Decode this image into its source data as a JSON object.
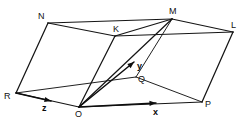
{
  "figure": {
    "kind": "parallelepiped-vector-diagram",
    "background_color": "#ffffff",
    "line_color": "#151515",
    "label_color": "#111111",
    "vertices": [
      {
        "id": "N",
        "label": "N",
        "point_x": 48,
        "point_y": 23,
        "label_x": 38,
        "label_y": 12
      },
      {
        "id": "M",
        "label": "M",
        "point_x": 172,
        "point_y": 19,
        "label_x": 169,
        "label_y": 7
      },
      {
        "id": "L",
        "label": "L",
        "point_x": 233,
        "point_y": 32,
        "label_x": 231,
        "label_y": 21
      },
      {
        "id": "K",
        "label": "K",
        "point_x": 115,
        "point_y": 36,
        "label_x": 113,
        "label_y": 25
      },
      {
        "id": "R",
        "label": "R",
        "point_x": 16,
        "point_y": 93,
        "label_x": 4,
        "label_y": 92
      },
      {
        "id": "O",
        "label": "O",
        "point_x": 79,
        "point_y": 107,
        "label_x": 75,
        "label_y": 110
      },
      {
        "id": "P",
        "label": "P",
        "point_x": 202,
        "point_y": 102,
        "label_x": 205,
        "label_y": 100
      },
      {
        "id": "Q",
        "label": "Q",
        "point_x": 136,
        "point_y": 77,
        "label_x": 138,
        "label_y": 75
      }
    ],
    "edges": [
      {
        "name": "edge-N-M",
        "from": "N",
        "to": "M"
      },
      {
        "name": "edge-M-L",
        "from": "M",
        "to": "L"
      },
      {
        "name": "edge-N-K",
        "from": "N",
        "to": "K"
      },
      {
        "name": "edge-K-M",
        "from": "K",
        "to": "M"
      },
      {
        "name": "edge-K-L",
        "from": "K",
        "to": "L"
      },
      {
        "name": "edge-N-R",
        "from": "N",
        "to": "R"
      },
      {
        "name": "edge-L-P",
        "from": "L",
        "to": "P"
      },
      {
        "name": "edge-K-O",
        "from": "K",
        "to": "O"
      },
      {
        "name": "edge-R-O",
        "from": "R",
        "to": "O"
      },
      {
        "name": "edge-O-P",
        "from": "O",
        "to": "P"
      },
      {
        "name": "edge-R-Q",
        "from": "R",
        "to": "Q"
      },
      {
        "name": "edge-Q-P",
        "from": "Q",
        "to": "P"
      },
      {
        "name": "edge-Q-M",
        "from": "Q",
        "to": "M"
      },
      {
        "name": "edge-O-M",
        "from": "O",
        "to": "M"
      }
    ],
    "axes": [
      {
        "id": "x",
        "label": "x",
        "origin_x": 79,
        "origin_y": 107,
        "tip_x": 156,
        "tip_y": 103,
        "label_x": 153,
        "label_y": 108
      },
      {
        "id": "y",
        "label": "y",
        "origin_x": 79,
        "origin_y": 107,
        "tip_x": 134,
        "tip_y": 62,
        "label_x": 137,
        "label_y": 62
      },
      {
        "id": "z",
        "label": "z",
        "origin_x": 16,
        "origin_y": 93,
        "tip_x": 51,
        "tip_y": 101,
        "label_x": 42,
        "label_y": 104
      }
    ]
  }
}
